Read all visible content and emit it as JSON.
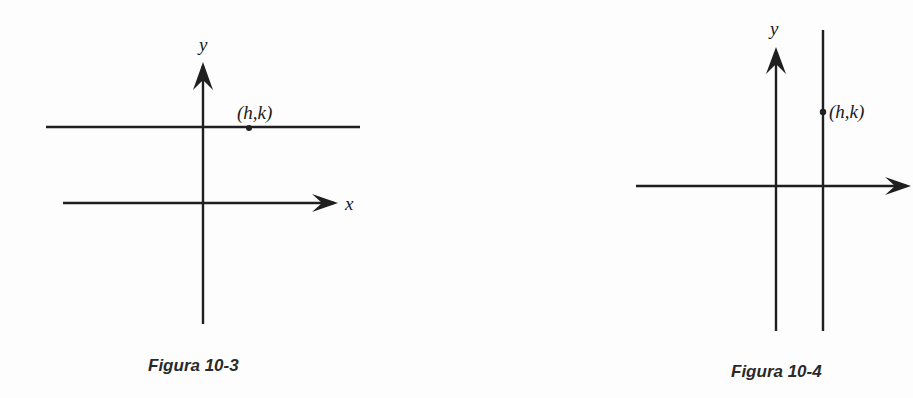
{
  "figures": [
    {
      "caption": "Figura 10-3",
      "y_axis_label": "y",
      "x_axis_label": "x",
      "point_label": "(h,k)",
      "line": "horizontal line through (h,k)"
    },
    {
      "caption": "Figura 10-4",
      "y_axis_label": "y",
      "x_axis_label": "",
      "point_label": "(h,k)",
      "line": "vertical line through (h,k)"
    }
  ],
  "colors": {
    "ink": "#1f1f1f",
    "background": "#fdfdfd"
  }
}
